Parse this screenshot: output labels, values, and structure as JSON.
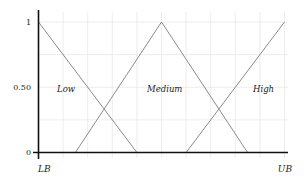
{
  "chart_data": {
    "type": "line",
    "title": "",
    "xlabel": "",
    "ylabel": "",
    "x_tick_labels": [
      "LB",
      "UB"
    ],
    "y_tick_labels": [
      "0",
      "0.50",
      "1"
    ],
    "ylim": [
      0,
      1
    ],
    "xlim": [
      0,
      1
    ],
    "grid": true,
    "legend": "inline labels",
    "series": [
      {
        "name": "Low",
        "x": [
          0.0,
          0.4
        ],
        "y": [
          1,
          0
        ],
        "label_pos": [
          0.09,
          0.5
        ]
      },
      {
        "name": "Medium",
        "x": [
          0.15,
          0.5,
          0.85
        ],
        "y": [
          0,
          1,
          0
        ],
        "label_pos": [
          0.46,
          0.5
        ]
      },
      {
        "name": "High",
        "x": [
          0.6,
          1.0
        ],
        "y": [
          0,
          1
        ],
        "label_pos": [
          0.87,
          0.5
        ]
      }
    ],
    "colors": {
      "axis": "#111111",
      "grid": "#e6e6e6",
      "lines": "#8a8a8a",
      "text": "#222222"
    }
  },
  "axes": {
    "y_ticks": {
      "top": "1",
      "mid": "0.50",
      "bottom": "0"
    },
    "x_ticks": {
      "left": "LB",
      "right": "UB"
    }
  },
  "labels": {
    "low": "Low",
    "medium": "Medium",
    "high": "High"
  }
}
